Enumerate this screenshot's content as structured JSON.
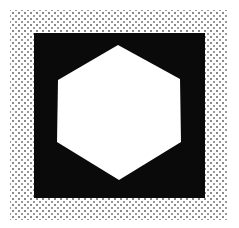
{
  "figure": {
    "colors": {
      "background": "#ffffff",
      "outer_dot": "#8a8a8a",
      "square_fill": "#0a0a0a",
      "square_dot": "#d8d8d8",
      "hexagon_fill": "#ffffff",
      "hexagon_dot": "#7a7a7a"
    },
    "outer_frame": {
      "x": 10,
      "y": 10,
      "width": 218,
      "height": 210
    },
    "square": {
      "x": 34,
      "y": 33,
      "width": 171,
      "height": 165
    },
    "hexagon": {
      "points": [
        [
          118,
          45
        ],
        [
          180,
          79
        ],
        [
          181,
          142
        ],
        [
          119,
          180
        ],
        [
          57,
          142
        ],
        [
          58,
          80
        ]
      ]
    }
  }
}
